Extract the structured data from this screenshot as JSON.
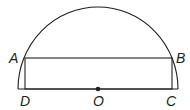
{
  "diagram": {
    "type": "semicircle-with-inscribed-rectangle",
    "colors": {
      "stroke": "#231f20",
      "background": "#ffffff"
    },
    "points": {
      "A": {
        "label": "A",
        "x": 25,
        "y": 58
      },
      "B": {
        "label": "B",
        "x": 172,
        "y": 58
      },
      "C": {
        "label": "C",
        "x": 172,
        "y": 89
      },
      "D": {
        "label": "D",
        "x": 25,
        "y": 89
      },
      "O": {
        "label": "O",
        "x": 98,
        "y": 89
      }
    },
    "labels": {
      "A": "A",
      "B": "B",
      "C": "C",
      "D": "D",
      "O": "O"
    }
  }
}
